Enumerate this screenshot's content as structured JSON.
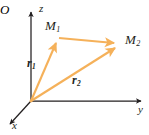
{
  "figure": {
    "kind": "3d-coordinate-vector-diagram",
    "width": 149,
    "height": 135,
    "background_color": "#ffffff",
    "axis_color": "#231f20",
    "vector_color": "#f2a košice"
  },
  "colors": {
    "axis": "#231f20",
    "vector": "#f5b15a",
    "vector_light": "#f8c98c",
    "text": "#231f20",
    "background": "#ffffff"
  },
  "axes": [
    {
      "id": "z",
      "label": "z",
      "direction": "up",
      "origin": [
        31,
        101
      ],
      "tip": [
        31,
        10
      ]
    },
    {
      "id": "y",
      "label": "y",
      "direction": "right",
      "origin": [
        31,
        101
      ],
      "tip": [
        143,
        101
      ]
    },
    {
      "id": "x",
      "label": "x",
      "direction": "down-left",
      "origin": [
        31,
        101
      ],
      "tip": [
        8,
        126
      ]
    }
  ],
  "origin": {
    "label": "O",
    "position": [
      31,
      101
    ]
  },
  "points": [
    {
      "id": "M1",
      "label": "M",
      "subscript": "1",
      "position": [
        58,
        38
      ]
    },
    {
      "id": "M2",
      "label": "M",
      "subscript": "2",
      "position": [
        119,
        45
      ]
    }
  ],
  "vectors": [
    {
      "id": "r1",
      "label": "r",
      "subscript": "1",
      "from": "O",
      "to": "M1",
      "from_point": [
        31,
        101
      ],
      "to_point": [
        58,
        38
      ],
      "label_position": [
        27,
        57
      ]
    },
    {
      "id": "r2",
      "label": "r",
      "subscript": "2",
      "from": "O",
      "to": "M2",
      "from_point": [
        31,
        101
      ],
      "to_point": [
        119,
        45
      ],
      "label_position": [
        72,
        74
      ]
    },
    {
      "id": "M1M2",
      "label": "",
      "subscript": "",
      "from": "M1",
      "to": "M2",
      "from_point": [
        58,
        38
      ],
      "to_point": [
        119,
        45
      ],
      "label_position": null
    }
  ],
  "labels": {
    "z_axis": "z",
    "y_axis": "y",
    "x_axis": "x",
    "origin": "O",
    "point_1": "M",
    "point_1_sub": "1",
    "point_2": "M",
    "point_2_sub": "2",
    "vector_1": "r",
    "vector_1_sub": "1",
    "vector_2": "r",
    "vector_2_sub": "2"
  }
}
